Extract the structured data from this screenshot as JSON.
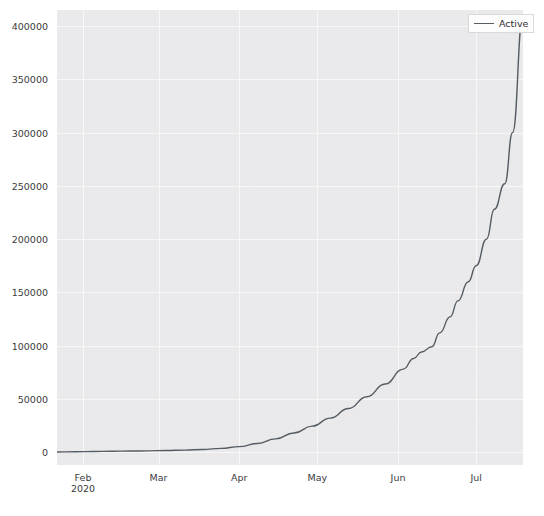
{
  "figure": {
    "background_color": "#ffffff",
    "panel_color": "#e9e9eb",
    "grid_color": "#f7f7f8"
  },
  "legend": {
    "position": "upper right",
    "entries": [
      {
        "label": "Active",
        "color": "#565c63"
      }
    ]
  },
  "chart_data": {
    "type": "line",
    "title": "",
    "xlabel": "",
    "ylabel": "",
    "grid": true,
    "legend_position": "upper right",
    "line_color": "#565c63",
    "line_width": 1.4,
    "ylim": [
      -12000,
      415000
    ],
    "xlim": [
      "2020-01-22",
      "2020-07-19"
    ],
    "ytick_labels": [
      "0",
      "50000",
      "100000",
      "150000",
      "200000",
      "250000",
      "300000",
      "350000",
      "400000"
    ],
    "ytick_values": [
      0,
      50000,
      100000,
      150000,
      200000,
      250000,
      300000,
      350000,
      400000
    ],
    "xtick_labels": [
      "Feb",
      "Mar",
      "Apr",
      "May",
      "Jun",
      "Jul"
    ],
    "xtick_sublabels": [
      "2020",
      "",
      "",
      "",
      "",
      ""
    ],
    "xtick_dates": [
      "2020-02-01",
      "2020-03-01",
      "2020-04-01",
      "2020-05-01",
      "2020-06-01",
      "2020-07-01"
    ],
    "series": [
      {
        "name": "Active",
        "color": "#565c63",
        "x": [
          "2020-01-22",
          "2020-01-29",
          "2020-02-05",
          "2020-02-12",
          "2020-02-19",
          "2020-02-26",
          "2020-03-04",
          "2020-03-11",
          "2020-03-18",
          "2020-03-25",
          "2020-04-01",
          "2020-04-08",
          "2020-04-15",
          "2020-04-22",
          "2020-04-29",
          "2020-05-06",
          "2020-05-13",
          "2020-05-20",
          "2020-05-27",
          "2020-06-03",
          "2020-06-07",
          "2020-06-10",
          "2020-06-14",
          "2020-06-17",
          "2020-06-21",
          "2020-06-24",
          "2020-06-28",
          "2020-07-01",
          "2020-07-05",
          "2020-07-08",
          "2020-07-12",
          "2020-07-15",
          "2020-07-19"
        ],
        "y": [
          200,
          400,
          700,
          900,
          1100,
          1300,
          1600,
          2000,
          2600,
          3600,
          5200,
          8200,
          12500,
          18000,
          24500,
          32000,
          41000,
          52000,
          64000,
          78000,
          88000,
          94000,
          99000,
          112000,
          127000,
          142000,
          160000,
          175000,
          200000,
          228000,
          252000,
          300000,
          410000
        ]
      }
    ],
    "annotations": [
      {
        "note": "exponential growth of active cases from late January to mid July 2020"
      }
    ]
  }
}
